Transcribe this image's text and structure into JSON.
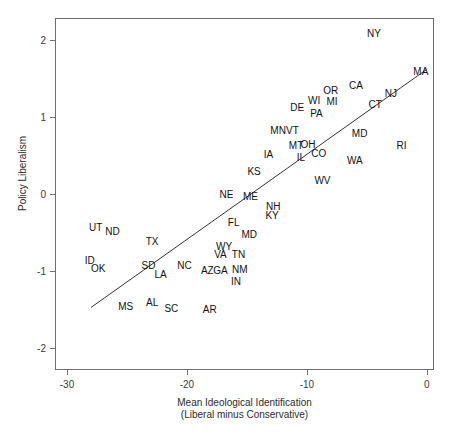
{
  "figure": {
    "top_fragment": "",
    "axes": {
      "x_title_line1": "Mean Ideological Identification",
      "x_title_line2": "(Liberal minus Conservative)",
      "y_title": "Policy Liberalism"
    }
  },
  "chart_data": {
    "type": "scatter",
    "title": "",
    "xlabel": "Mean Ideological Identification (Liberal minus Conservative)",
    "ylabel": "Policy Liberalism",
    "xlim": [
      -31.0,
      0.6
    ],
    "ylim": [
      -2.28,
      2.28
    ],
    "xticks": [
      -30,
      -20,
      -10,
      0
    ],
    "xtick_labels": [
      "-30",
      "-20",
      "-10",
      "0"
    ],
    "yticks": [
      2,
      1,
      0,
      -1,
      -2
    ],
    "ytick_labels": [
      "2",
      "1",
      "0",
      "-1",
      "-2"
    ],
    "grid": false,
    "legend": null,
    "marker_style": "text-label",
    "fit_line": {
      "type": "linear-regression",
      "x_start": -28.0,
      "y_start": -1.47,
      "x_end": -0.05,
      "y_end": 1.61
    },
    "points": [
      {
        "label": "NY",
        "x": -4.4,
        "y": 2.07
      },
      {
        "label": "MA",
        "x": -0.5,
        "y": 1.58
      },
      {
        "label": "CA",
        "x": -5.9,
        "y": 1.4
      },
      {
        "label": "OR",
        "x": -8.0,
        "y": 1.33
      },
      {
        "label": "NJ",
        "x": -3.0,
        "y": 1.29
      },
      {
        "label": "WI",
        "x": -9.4,
        "y": 1.21
      },
      {
        "label": "MI",
        "x": -7.9,
        "y": 1.19
      },
      {
        "label": "CT",
        "x": -4.3,
        "y": 1.15
      },
      {
        "label": "DE",
        "x": -10.8,
        "y": 1.12
      },
      {
        "label": "PA",
        "x": -9.2,
        "y": 1.03
      },
      {
        "label": "MN",
        "x": -12.4,
        "y": 0.82
      },
      {
        "label": "VT",
        "x": -11.2,
        "y": 0.82
      },
      {
        "label": "MD",
        "x": -5.6,
        "y": 0.78
      },
      {
        "label": "OH",
        "x": -9.9,
        "y": 0.64
      },
      {
        "label": "MT",
        "x": -10.9,
        "y": 0.62
      },
      {
        "label": "RI",
        "x": -2.1,
        "y": 0.62
      },
      {
        "label": "CO",
        "x": -9.0,
        "y": 0.52
      },
      {
        "label": "IA",
        "x": -13.2,
        "y": 0.5
      },
      {
        "label": "IL",
        "x": -10.5,
        "y": 0.46
      },
      {
        "label": "WA",
        "x": -6.0,
        "y": 0.43
      },
      {
        "label": "KS",
        "x": -14.4,
        "y": 0.28
      },
      {
        "label": "WV",
        "x": -8.7,
        "y": 0.17
      },
      {
        "label": "NE",
        "x": -16.7,
        "y": -0.01
      },
      {
        "label": "ME",
        "x": -14.7,
        "y": -0.04
      },
      {
        "label": "NH",
        "x": -12.8,
        "y": -0.17
      },
      {
        "label": "KY",
        "x": -12.9,
        "y": -0.29
      },
      {
        "label": "FL",
        "x": -16.1,
        "y": -0.38
      },
      {
        "label": "UT",
        "x": -27.6,
        "y": -0.44
      },
      {
        "label": "ND",
        "x": -26.2,
        "y": -0.49
      },
      {
        "label": "MD",
        "x": -14.8,
        "y": -0.53
      },
      {
        "label": "TX",
        "x": -22.9,
        "y": -0.62
      },
      {
        "label": "WY",
        "x": -16.9,
        "y": -0.69
      },
      {
        "label": "VA",
        "x": -17.2,
        "y": -0.79
      },
      {
        "label": "TN",
        "x": -15.7,
        "y": -0.79
      },
      {
        "label": "ID",
        "x": -28.1,
        "y": -0.87
      },
      {
        "label": "SD",
        "x": -23.2,
        "y": -0.93
      },
      {
        "label": "NC",
        "x": -20.2,
        "y": -0.93
      },
      {
        "label": "OK",
        "x": -27.4,
        "y": -0.97
      },
      {
        "label": "AZ",
        "x": -18.3,
        "y": -1.0
      },
      {
        "label": "GA",
        "x": -17.2,
        "y": -1.0
      },
      {
        "label": "NM",
        "x": -15.6,
        "y": -0.98
      },
      {
        "label": "LA",
        "x": -22.2,
        "y": -1.05
      },
      {
        "label": "IN",
        "x": -15.9,
        "y": -1.14
      },
      {
        "label": "AL",
        "x": -22.9,
        "y": -1.41
      },
      {
        "label": "MS",
        "x": -25.1,
        "y": -1.47
      },
      {
        "label": "SC",
        "x": -21.3,
        "y": -1.49
      },
      {
        "label": "AR",
        "x": -18.1,
        "y": -1.5
      }
    ]
  }
}
